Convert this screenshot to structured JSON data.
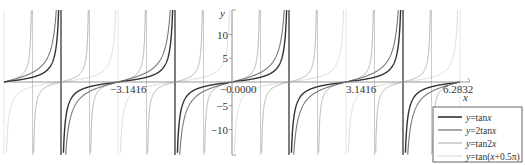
{
  "chart_data": {
    "type": "line",
    "title": "",
    "xlabel": "x",
    "ylabel": "y",
    "xlim": [
      -6.2832,
      6.2832
    ],
    "ylim": [
      -15,
      15
    ],
    "grid": false,
    "legend_position": "lower right",
    "x_ticks": [
      {
        "value": -3.1416,
        "label": "−3.1416"
      },
      {
        "value": 0,
        "label": "−0.0000"
      },
      {
        "value": 3.1416,
        "label": "3.1416"
      },
      {
        "value": 6.2832,
        "label": "6.2832"
      }
    ],
    "y_ticks": [
      {
        "value": 10,
        "label": "10"
      },
      {
        "value": 5,
        "label": "5"
      },
      {
        "value": -5,
        "label": "−5"
      },
      {
        "value": -10,
        "label": "−10"
      }
    ],
    "series": [
      {
        "name": "y=tanx",
        "legend_prefix": "y",
        "legend_rest": "=tan",
        "legend_var": "x",
        "legend_tail": "",
        "fn": "tanx",
        "color": "#333333",
        "width": 1.4
      },
      {
        "name": "y=2tanx",
        "legend_prefix": "y",
        "legend_rest": "=2tan",
        "legend_var": "x",
        "legend_tail": "",
        "fn": "2tanx",
        "color": "#777777",
        "width": 1.1
      },
      {
        "name": "y=tan2x",
        "legend_prefix": "y",
        "legend_rest": "=tan2",
        "legend_var": "x",
        "legend_tail": "",
        "fn": "tan2x",
        "color": "#b4b4b4",
        "width": 1.0
      },
      {
        "name": "y=tan(x+0.5π)",
        "legend_prefix": "y",
        "legend_rest": "=tan(",
        "legend_var": "x",
        "legend_tail": "+0.5π)",
        "fn": "tanxhalfpi",
        "color": "#dcdcdc",
        "width": 1.0
      }
    ]
  },
  "axes": {
    "x_label": "x",
    "y_label": "y"
  },
  "legend": {
    "items": [
      {
        "label": "y=tanx"
      },
      {
        "label": "y=2tanx"
      },
      {
        "label": "y=tan2x"
      },
      {
        "label": "y=tan(x+0.5π)"
      }
    ]
  }
}
